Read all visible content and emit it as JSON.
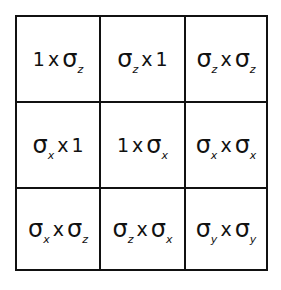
{
  "operator_symbol": "σ",
  "times_symbol": "x",
  "cells": [
    [
      {
        "left": {
          "base": "1",
          "sub": ""
        },
        "right": {
          "base": "σ",
          "sub": "z"
        }
      },
      {
        "left": {
          "base": "σ",
          "sub": "z"
        },
        "right": {
          "base": "1",
          "sub": ""
        }
      },
      {
        "left": {
          "base": "σ",
          "sub": "z"
        },
        "right": {
          "base": "σ",
          "sub": "z"
        }
      }
    ],
    [
      {
        "left": {
          "base": "σ",
          "sub": "x"
        },
        "right": {
          "base": "1",
          "sub": ""
        }
      },
      {
        "left": {
          "base": "1",
          "sub": ""
        },
        "right": {
          "base": "σ",
          "sub": "x"
        }
      },
      {
        "left": {
          "base": "σ",
          "sub": "x"
        },
        "right": {
          "base": "σ",
          "sub": "x"
        }
      }
    ],
    [
      {
        "left": {
          "base": "σ",
          "sub": "x"
        },
        "right": {
          "base": "σ",
          "sub": "z"
        }
      },
      {
        "left": {
          "base": "σ",
          "sub": "z"
        },
        "right": {
          "base": "σ",
          "sub": "x"
        }
      },
      {
        "left": {
          "base": "σ",
          "sub": "y"
        },
        "right": {
          "base": "σ",
          "sub": "y"
        }
      }
    ]
  ],
  "colors": {
    "line": "#111111",
    "text": "#111111",
    "background": "#ffffff"
  }
}
